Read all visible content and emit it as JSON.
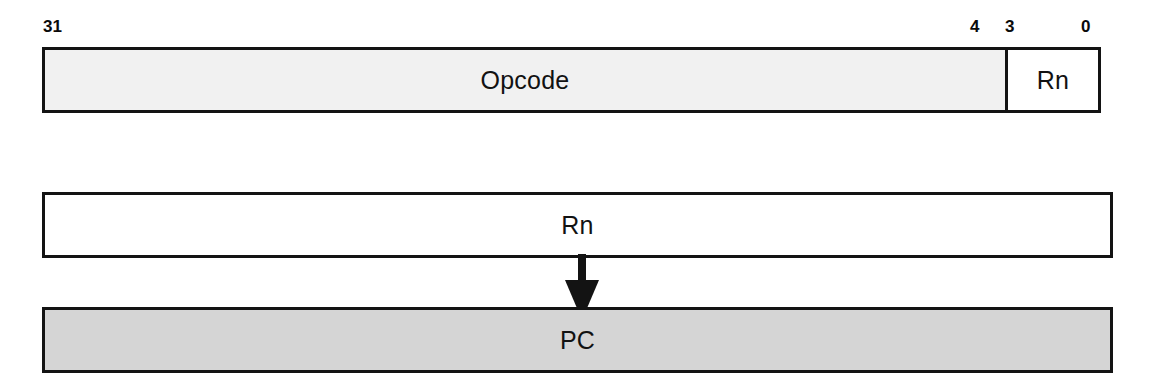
{
  "diagram": {
    "instruction_word": {
      "name": "32-bit instruction word",
      "bit_labels": {
        "msb": "31",
        "field_boundary_high": "4",
        "field_boundary_low": "3",
        "lsb": "0"
      },
      "fields": [
        {
          "label": "Opcode",
          "bit_high": "31",
          "bit_low": "4",
          "fill": "#f1f1f1"
        },
        {
          "label": "Rn",
          "bit_high": "3",
          "bit_low": "0",
          "fill": "#ffffff"
        }
      ]
    },
    "registers": {
      "source": {
        "label": "Rn",
        "fill": "#ffffff"
      },
      "destination": {
        "label": "PC",
        "fill": "#d5d5d5"
      }
    },
    "arrow": {
      "name": "down-arrow",
      "direction": "down",
      "from": "Rn",
      "to": "PC",
      "color": "#131313"
    },
    "colors": {
      "border": "#131313",
      "text": "#121212",
      "background": "#ffffff"
    }
  }
}
